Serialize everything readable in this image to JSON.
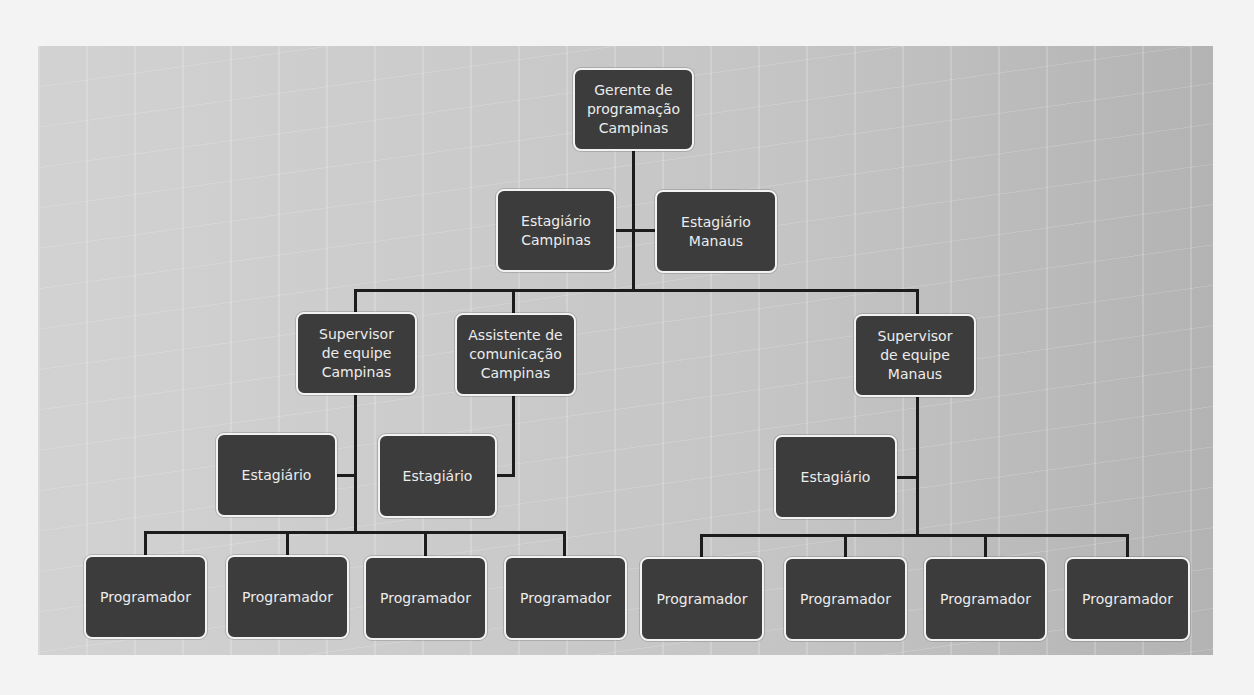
{
  "chart_data": {
    "type": "org-chart",
    "nodes": [
      {
        "id": "gerente",
        "label": "Gerente de\nprogramação\nCampinas",
        "x": 573,
        "y": 68,
        "w": 121,
        "h": 83
      },
      {
        "id": "est-campinas",
        "label": "Estagiário\nCampinas",
        "x": 496,
        "y": 189,
        "w": 120,
        "h": 83
      },
      {
        "id": "est-manaus",
        "label": "Estagiário\nManaus",
        "x": 655,
        "y": 190,
        "w": 122,
        "h": 83
      },
      {
        "id": "sup-campinas",
        "label": "Supervisor\nde equipe\nCampinas",
        "x": 296,
        "y": 312,
        "w": 121,
        "h": 83
      },
      {
        "id": "assist-campinas",
        "label": "Assistente de\ncomunicação\nCampinas",
        "x": 455,
        "y": 313,
        "w": 121,
        "h": 83
      },
      {
        "id": "sup-manaus",
        "label": "Supervisor\nde equipe\nManaus",
        "x": 854,
        "y": 314,
        "w": 122,
        "h": 83
      },
      {
        "id": "est-sup-campinas",
        "label": "Estagiário",
        "x": 216,
        "y": 433,
        "w": 121,
        "h": 84
      },
      {
        "id": "est-assist",
        "label": "Estagiário",
        "x": 378,
        "y": 434,
        "w": 119,
        "h": 84
      },
      {
        "id": "est-sup-manaus",
        "label": "Estagiário",
        "x": 774,
        "y": 435,
        "w": 123,
        "h": 84
      },
      {
        "id": "prog-1",
        "label": "Programador",
        "x": 84,
        "y": 555,
        "w": 123,
        "h": 84
      },
      {
        "id": "prog-2",
        "label": "Programador",
        "x": 226,
        "y": 555,
        "w": 123,
        "h": 84
      },
      {
        "id": "prog-3",
        "label": "Programador",
        "x": 364,
        "y": 556,
        "w": 123,
        "h": 84
      },
      {
        "id": "prog-4",
        "label": "Programador",
        "x": 504,
        "y": 556,
        "w": 123,
        "h": 84
      },
      {
        "id": "prog-5",
        "label": "Programador",
        "x": 640,
        "y": 557,
        "w": 124,
        "h": 84
      },
      {
        "id": "prog-6",
        "label": "Programador",
        "x": 784,
        "y": 557,
        "w": 123,
        "h": 84
      },
      {
        "id": "prog-7",
        "label": "Programador",
        "x": 924,
        "y": 557,
        "w": 123,
        "h": 84
      },
      {
        "id": "prog-8",
        "label": "Programador",
        "x": 1065,
        "y": 557,
        "w": 125,
        "h": 84
      }
    ],
    "edges": [
      [
        "gerente",
        "est-campinas"
      ],
      [
        "gerente",
        "est-manaus"
      ],
      [
        "gerente",
        "sup-campinas"
      ],
      [
        "gerente",
        "assist-campinas"
      ],
      [
        "gerente",
        "sup-manaus"
      ],
      [
        "sup-campinas",
        "est-sup-campinas"
      ],
      [
        "assist-campinas",
        "est-assist"
      ],
      [
        "sup-manaus",
        "est-sup-manaus"
      ],
      [
        "sup-campinas",
        "prog-1"
      ],
      [
        "sup-campinas",
        "prog-2"
      ],
      [
        "sup-campinas",
        "prog-3"
      ],
      [
        "sup-campinas",
        "prog-4"
      ],
      [
        "sup-manaus",
        "prog-5"
      ],
      [
        "sup-manaus",
        "prog-6"
      ],
      [
        "sup-manaus",
        "prog-7"
      ],
      [
        "sup-manaus",
        "prog-8"
      ]
    ]
  },
  "lines": [
    {
      "x": 632,
      "y": 150,
      "w": 3,
      "h": 142
    },
    {
      "x": 615,
      "y": 229,
      "w": 41,
      "h": 3
    },
    {
      "x": 354,
      "y": 289,
      "w": 565,
      "h": 3
    },
    {
      "x": 354,
      "y": 289,
      "w": 3,
      "h": 24
    },
    {
      "x": 512,
      "y": 289,
      "w": 3,
      "h": 25
    },
    {
      "x": 916,
      "y": 289,
      "w": 3,
      "h": 26
    },
    {
      "x": 354,
      "y": 394,
      "w": 3,
      "h": 140
    },
    {
      "x": 336,
      "y": 474,
      "w": 20,
      "h": 3
    },
    {
      "x": 512,
      "y": 395,
      "w": 3,
      "h": 82
    },
    {
      "x": 496,
      "y": 474,
      "w": 19,
      "h": 3
    },
    {
      "x": 144,
      "y": 531,
      "w": 422,
      "h": 3
    },
    {
      "x": 144,
      "y": 531,
      "w": 3,
      "h": 25
    },
    {
      "x": 286,
      "y": 531,
      "w": 3,
      "h": 25
    },
    {
      "x": 424,
      "y": 531,
      "w": 3,
      "h": 26
    },
    {
      "x": 563,
      "y": 531,
      "w": 3,
      "h": 26
    },
    {
      "x": 916,
      "y": 396,
      "w": 3,
      "h": 140
    },
    {
      "x": 896,
      "y": 476,
      "w": 22,
      "h": 3
    },
    {
      "x": 700,
      "y": 534,
      "w": 429,
      "h": 3
    },
    {
      "x": 700,
      "y": 534,
      "w": 3,
      "h": 24
    },
    {
      "x": 844,
      "y": 534,
      "w": 3,
      "h": 24
    },
    {
      "x": 984,
      "y": 534,
      "w": 3,
      "h": 24
    },
    {
      "x": 1126,
      "y": 534,
      "w": 3,
      "h": 24
    }
  ]
}
